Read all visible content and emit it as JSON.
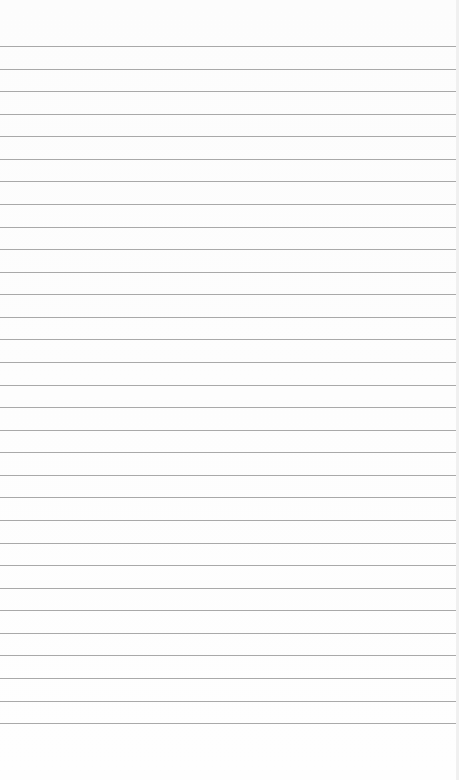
{
  "image": {
    "description": "blank ruled lined paper",
    "paper_color": "#fdfdfd",
    "line_color": "#a9a9a9",
    "line_count": 31,
    "first_line_y": 46,
    "line_spacing": 22.57
  }
}
